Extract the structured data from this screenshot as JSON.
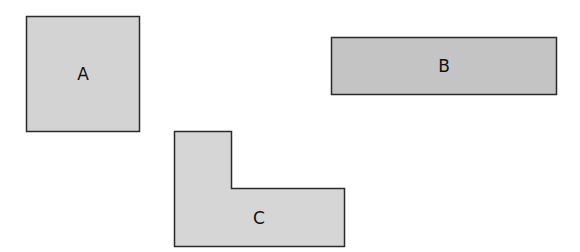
{
  "diagram": {
    "shapes": [
      {
        "id": "A",
        "label": "A",
        "kind": "square",
        "fill": "#d3d3d3"
      },
      {
        "id": "B",
        "label": "B",
        "kind": "rectangle",
        "fill": "#c4c4c4"
      },
      {
        "id": "C",
        "label": "C",
        "kind": "L-shape",
        "fill": "#d6d6d6"
      }
    ],
    "stroke": "#2a2a2a"
  }
}
